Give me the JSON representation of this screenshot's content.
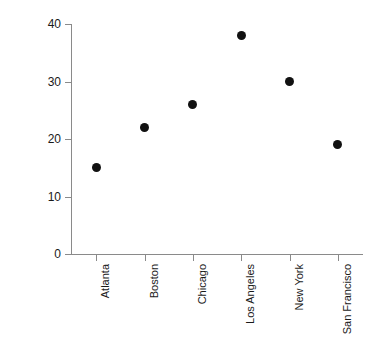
{
  "chart_data": {
    "type": "scatter",
    "title": "",
    "xlabel": "",
    "ylabel": "Median commute time (minutes)",
    "categories": [
      "Atlanta",
      "Boston",
      "Chicago",
      "Los Angeles",
      "New York",
      "San Francisco"
    ],
    "values": [
      15,
      22,
      26,
      38,
      30,
      19
    ],
    "ylim": [
      0,
      40
    ],
    "yticks": [
      0,
      10,
      20,
      30,
      40
    ],
    "ytick_labels": [
      "0",
      "10",
      "20",
      "30",
      "40"
    ],
    "grid": false,
    "legend": false,
    "marker": {
      "shape": "circle",
      "color": "#111111",
      "size_px": 9
    },
    "axis_color": "#8a8a8a",
    "background": "#ffffff",
    "xtick_label_rotation": 90
  }
}
